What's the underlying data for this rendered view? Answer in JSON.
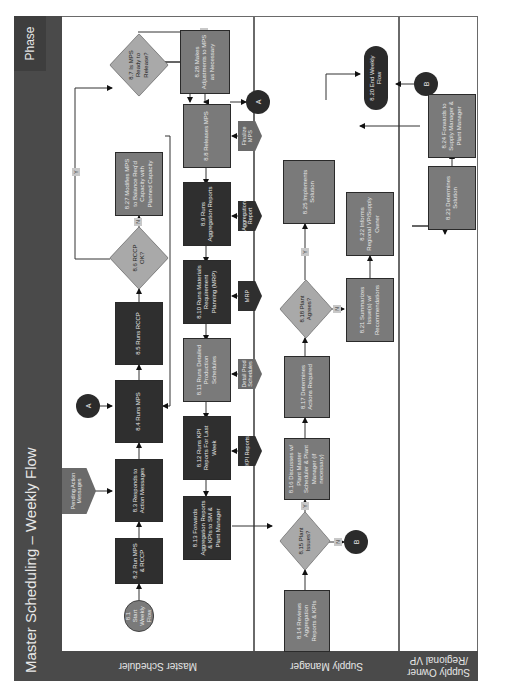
{
  "diagram": {
    "title": "Master Scheduling – Weekly Flow",
    "phase_label": "Phase",
    "lanes": [
      {
        "label": "Master Scheduler"
      },
      {
        "label": "Supply Manager"
      },
      {
        "label": "Supply Owner /Regional VP"
      }
    ],
    "connectors": {
      "A": "A",
      "B": "B"
    },
    "yes_label": "Y",
    "no_label": "N",
    "steps": {
      "s8_1": "8.1 Start Weekly Flow",
      "s8_2": "8.2 Run MPS & RCCP",
      "s8_3": "8.3 Responds to Action Messages",
      "s8_4": "8.4 Runs MPS",
      "s8_5": "8.5 Runs RCCP",
      "s8_6": "8.6 RCCP OK?",
      "s8_7": "8.7 Is MPS Ready to Release?",
      "s8_8": "8.8 Releases MPS",
      "s8_9": "8.9 Runs Aggregation Reports",
      "s8_10": "8.10 Runs Materials Requirement Planning (MRP)",
      "s8_11": "8.11 Runs Detailed Production Schedules",
      "s8_12": "8.12 Runs KPI Reports For Last Week",
      "s8_13": "8.13 Forwards Aggregation Reports & KPIs to SM & Plant Manager",
      "s8_14": "8.14 Reviews Aggregation Reports & KPIs",
      "s8_15": "8.15 Plant Issues?",
      "s8_16": "8.16 Discusses w/ Plant Master Scheduler & Plant Manager (if necessary)",
      "s8_17": "8.17 Determines Actions Required",
      "s8_18": "8.18 Plant Agrees?",
      "s8_20": "8.20 End Weekly Flow",
      "s8_21": "8.21 Summarizes Issue(s) w/ Recommendations",
      "s8_22": "8.22 Informs Regional VP/Supply Owner",
      "s8_23": "8.23 Determines Solution",
      "s8_24": "8.24 Forwards to Supply Manager & Plant Manager",
      "s8_25": "8.25 Implements Solution",
      "s8_27": "8.27 Modifies MPS to Balance Req'd Capacity with Planned Capacity",
      "s8_28": "8.28 Makes Adjustments to MPS as Necessary"
    },
    "documents": {
      "pending_action": "Pending Action Messages",
      "finalize_mps": "Finalize MPS",
      "aggregation_report": "Aggregation Report",
      "mrp": "MRP",
      "detail_prod": "Detail Prod Schedules",
      "kpi_reports": "KPI Reports"
    }
  }
}
